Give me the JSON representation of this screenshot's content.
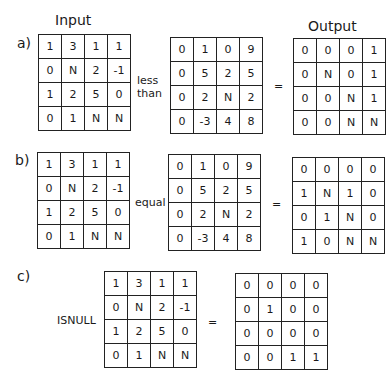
{
  "headers": {
    "input": "Input",
    "output": "Output"
  },
  "panels": [
    {
      "label": "a)",
      "operator": [
        "less",
        "than"
      ],
      "equals": "=",
      "left": [
        [
          "1",
          "3",
          "1",
          "1"
        ],
        [
          "0",
          "N",
          "2",
          "-1"
        ],
        [
          "1",
          "2",
          "5",
          "0"
        ],
        [
          "0",
          "1",
          "N",
          "N"
        ]
      ],
      "right": [
        [
          "0",
          "1",
          "0",
          "9"
        ],
        [
          "0",
          "5",
          "2",
          "5"
        ],
        [
          "0",
          "2",
          "N",
          "2"
        ],
        [
          "0",
          "-3",
          "4",
          "8"
        ]
      ],
      "output": [
        [
          "0",
          "0",
          "0",
          "1"
        ],
        [
          "0",
          "N",
          "0",
          "1"
        ],
        [
          "0",
          "0",
          "N",
          "1"
        ],
        [
          "0",
          "0",
          "N",
          "N"
        ]
      ]
    },
    {
      "label": "b)",
      "operator": [
        "equal"
      ],
      "equals": "=",
      "left": [
        [
          "1",
          "3",
          "1",
          "1"
        ],
        [
          "0",
          "N",
          "2",
          "-1"
        ],
        [
          "1",
          "2",
          "5",
          "0"
        ],
        [
          "0",
          "1",
          "N",
          "N"
        ]
      ],
      "right": [
        [
          "0",
          "1",
          "0",
          "9"
        ],
        [
          "0",
          "5",
          "2",
          "5"
        ],
        [
          "0",
          "2",
          "N",
          "2"
        ],
        [
          "0",
          "-3",
          "4",
          "8"
        ]
      ],
      "output": [
        [
          "0",
          "0",
          "0",
          "0"
        ],
        [
          "1",
          "N",
          "1",
          "0"
        ],
        [
          "0",
          "1",
          "N",
          "0"
        ],
        [
          "1",
          "0",
          "N",
          "N"
        ]
      ]
    },
    {
      "label": "c)",
      "operator": [
        "ISNULL"
      ],
      "equals": "=",
      "left": [
        [
          "1",
          "3",
          "1",
          "1"
        ],
        [
          "0",
          "N",
          "2",
          "-1"
        ],
        [
          "1",
          "2",
          "5",
          "0"
        ],
        [
          "0",
          "1",
          "N",
          "N"
        ]
      ],
      "output": [
        [
          "0",
          "0",
          "0",
          "0"
        ],
        [
          "0",
          "1",
          "0",
          "0"
        ],
        [
          "0",
          "0",
          "0",
          "0"
        ],
        [
          "0",
          "0",
          "1",
          "1"
        ]
      ]
    }
  ]
}
